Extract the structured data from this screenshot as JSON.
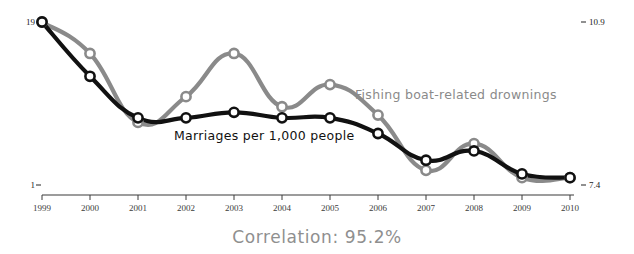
{
  "chart_data": {
    "type": "line",
    "title": "",
    "subtitle": "",
    "xlabel": "",
    "ylabel": "",
    "grid": false,
    "legend_position": "inline-annotation",
    "categories": [
      1999,
      2000,
      2001,
      2002,
      2003,
      2004,
      2005,
      2006,
      2007,
      2008,
      2009,
      2010
    ],
    "x_tick_labels": [
      "1999",
      "2000",
      "2001",
      "2002",
      "2003",
      "2004",
      "2005",
      "2006",
      "2007",
      "2008",
      "2009",
      "2010"
    ],
    "axes": {
      "left": {
        "top_label": "19",
        "bottom_label": "1",
        "range": [
          1,
          19
        ],
        "unit": "marriages per 1,000 people"
      },
      "right": {
        "top_label": "10.9",
        "bottom_label": "7.4",
        "range": [
          7.4,
          10.9
        ],
        "unit": "drownings"
      }
    },
    "series": [
      {
        "name": "Marriages per 1,000 people",
        "axis": "left",
        "color": "#111111",
        "annotation_label": "Marriages per 1,000 people",
        "values": [
          10.3,
          8.8,
          8.0,
          8.1,
          8.2,
          8.1,
          8.2,
          7.9,
          7.4,
          7.6,
          7.0,
          6.9
        ],
        "plot_y_fraction": [
          0.0,
          0.333,
          0.588,
          0.588,
          0.554,
          0.588,
          0.588,
          0.684,
          0.848,
          0.791,
          0.932,
          0.955
        ]
      },
      {
        "name": "Fishing boat-related drownings",
        "axis": "right",
        "color": "#8a8a8a",
        "annotation_label": "Fishing boat-related drownings",
        "values": [
          10.9,
          9.8,
          8.0,
          8.7,
          9.8,
          8.4,
          9.0,
          8.3,
          7.5,
          8.1,
          7.0,
          7.4
        ],
        "plot_y_fraction": [
          0.0,
          0.193,
          0.616,
          0.458,
          0.193,
          0.52,
          0.384,
          0.571,
          0.91,
          0.746,
          0.955,
          0.955
        ]
      }
    ],
    "annotations": [
      {
        "id": "gray-series-label",
        "text": "Fishing boat-related drownings",
        "x": 355,
        "y": 99
      },
      {
        "id": "black-series-label",
        "text": "Marriages per 1,000 people",
        "x": 174,
        "y": 140
      }
    ],
    "caption": "Correlation: 95.2%",
    "colors": {
      "series_black": "#111111",
      "series_gray": "#8a8a8a",
      "axis": "#3a3a3a",
      "caption": "#8f8f8f",
      "background": "#ffffff",
      "marker_fill": "#ffffff"
    }
  }
}
